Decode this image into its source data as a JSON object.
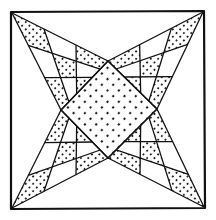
{
  "figure": {
    "width": 216,
    "height": 220,
    "colors": {
      "background": "#ffffff",
      "ink": "#111111",
      "dot": "#111111"
    },
    "frame": {
      "corners": [
        [
          11,
          12
        ],
        [
          204,
          11
        ],
        [
          205,
          208
        ],
        [
          11,
          209
        ]
      ],
      "stroke_width": 2.2
    },
    "center_diamond": {
      "vertices": [
        [
          108,
          61
        ],
        [
          157,
          109
        ],
        [
          108,
          158
        ],
        [
          61,
          110
        ]
      ],
      "fill": "dots",
      "dot_spacing": 8,
      "dot_radius": 1.15
    },
    "arms": [
      {
        "name": "top-left",
        "tip": [
          12,
          13
        ],
        "edge_a": [
          108,
          61
        ],
        "edge_b": [
          61,
          110
        ],
        "grid": 3,
        "dotted_cells": [
          [
            0,
            0
          ],
          [
            1,
            1
          ],
          [
            2,
            2
          ],
          [
            0,
            2
          ],
          [
            2,
            0
          ]
        ]
      },
      {
        "name": "top-right",
        "tip": [
          203,
          12
        ],
        "edge_a": [
          157,
          109
        ],
        "edge_b": [
          108,
          61
        ],
        "grid": 3,
        "dotted_cells": [
          [
            0,
            0
          ],
          [
            1,
            1
          ],
          [
            2,
            2
          ],
          [
            0,
            2
          ],
          [
            2,
            0
          ]
        ]
      },
      {
        "name": "bottom-right",
        "tip": [
          204,
          207
        ],
        "edge_a": [
          108,
          158
        ],
        "edge_b": [
          157,
          109
        ],
        "grid": 3,
        "dotted_cells": [
          [
            0,
            0
          ],
          [
            1,
            1
          ],
          [
            2,
            2
          ],
          [
            0,
            2
          ],
          [
            2,
            0
          ]
        ]
      },
      {
        "name": "bottom-left",
        "tip": [
          12,
          208
        ],
        "edge_a": [
          61,
          110
        ],
        "edge_b": [
          108,
          158
        ],
        "grid": 3,
        "dotted_cells": [
          [
            0,
            0
          ],
          [
            1,
            1
          ],
          [
            2,
            2
          ],
          [
            0,
            2
          ],
          [
            2,
            0
          ]
        ]
      }
    ],
    "cell_dot_spacing": 5.2,
    "cell_dot_radius": 1.0,
    "line_width": 1.3
  }
}
